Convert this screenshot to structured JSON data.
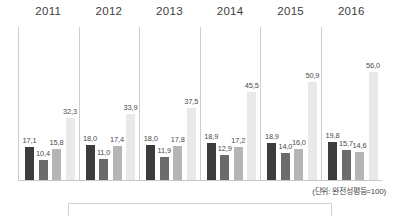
{
  "footnote": "(단위: 완전성평등=100)",
  "colors": {
    "series_0": "#3c3c3c",
    "series_1": "#6b6b6b",
    "series_2": "#b5b5b5",
    "series_3": "#e9e9e9",
    "separator": "#cdcdcd",
    "baseline": "#c8c8c8",
    "label_text": "#4a4a4a",
    "year_text": "#3d3d3d"
  },
  "chart_data": {
    "type": "bar",
    "title": "",
    "subtitle": "",
    "xlabel": "",
    "ylabel": "",
    "unit_note": "(단위: 완전성평등=100)",
    "grid": false,
    "legend_position": "bottom",
    "ylim": [
      0,
      60
    ],
    "categories": [
      "2011",
      "2012",
      "2013",
      "2014",
      "2015",
      "2016"
    ],
    "series": [
      {
        "name": "",
        "values": [
          17.1,
          18.0,
          18.0,
          18.9,
          18.9,
          19.8
        ]
      },
      {
        "name": "",
        "values": [
          10.4,
          11.0,
          11.9,
          12.9,
          14.0,
          15.7
        ]
      },
      {
        "name": "",
        "values": [
          15.8,
          17.4,
          17.8,
          17.2,
          16.0,
          14.6
        ]
      },
      {
        "name": "",
        "values": [
          32.3,
          33.9,
          37.5,
          45.5,
          50.9,
          56.0
        ]
      }
    ],
    "groups": [
      {
        "year": "2011",
        "bars": [
          {
            "label": "17,1",
            "value": 17.1,
            "series": 0
          },
          {
            "label": "10,4",
            "value": 10.4,
            "series": 1
          },
          {
            "label": "15,8",
            "value": 15.8,
            "series": 2
          },
          {
            "label": "32,3",
            "value": 32.3,
            "series": 3
          }
        ]
      },
      {
        "year": "2012",
        "bars": [
          {
            "label": "18,0",
            "value": 18.0,
            "series": 0
          },
          {
            "label": "11,0",
            "value": 11.0,
            "series": 1
          },
          {
            "label": "17,4",
            "value": 17.4,
            "series": 2
          },
          {
            "label": "33,9",
            "value": 33.9,
            "series": 3
          }
        ]
      },
      {
        "year": "2013",
        "bars": [
          {
            "label": "18,0",
            "value": 18.0,
            "series": 0
          },
          {
            "label": "11,9",
            "value": 11.9,
            "series": 1
          },
          {
            "label": "17,8",
            "value": 17.8,
            "series": 2
          },
          {
            "label": "37,5",
            "value": 37.5,
            "series": 3
          }
        ]
      },
      {
        "year": "2014",
        "bars": [
          {
            "label": "18,9",
            "value": 18.9,
            "series": 0
          },
          {
            "label": "12,9",
            "value": 12.9,
            "series": 1
          },
          {
            "label": "17,2",
            "value": 17.2,
            "series": 2
          },
          {
            "label": "45,5",
            "value": 45.5,
            "series": 3
          }
        ]
      },
      {
        "year": "2015",
        "bars": [
          {
            "label": "18,9",
            "value": 18.9,
            "series": 0
          },
          {
            "label": "14,0",
            "value": 14.0,
            "series": 1
          },
          {
            "label": "16,0",
            "value": 16.0,
            "series": 2
          },
          {
            "label": "50,9",
            "value": 50.9,
            "series": 3
          }
        ]
      },
      {
        "year": "2016",
        "bars": [
          {
            "label": "19,8",
            "value": 19.8,
            "series": 0
          },
          {
            "label": "15,7",
            "value": 15.7,
            "series": 1
          },
          {
            "label": "14,6",
            "value": 14.6,
            "series": 2
          },
          {
            "label": "56,0",
            "value": 56.0,
            "series": 3
          }
        ]
      }
    ]
  }
}
